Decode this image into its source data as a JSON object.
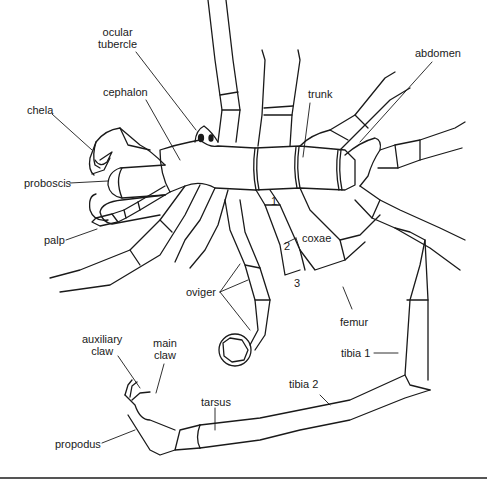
{
  "figure": {
    "line_color": "#1a1a1a",
    "background": "#ffffff"
  },
  "labels": {
    "ocular_line1": "ocular",
    "ocular_line2": "tubercle",
    "cephalon": "cephalon",
    "chela": "chela",
    "proboscis": "proboscis",
    "palp": "palp",
    "trunk": "trunk",
    "abdomen": "abdomen",
    "coxae": "coxae",
    "coxa_1": "1",
    "coxa_2": "2",
    "coxa_3": "3",
    "oviger": "oviger",
    "femur": "femur",
    "tibia1": "tibia 1",
    "tibia2": "tibia 2",
    "tarsus": "tarsus",
    "auxiliary_line1": "auxiliary",
    "auxiliary_line2": "claw",
    "main_line1": "main",
    "main_line2": "claw",
    "propodus": "propodus"
  }
}
